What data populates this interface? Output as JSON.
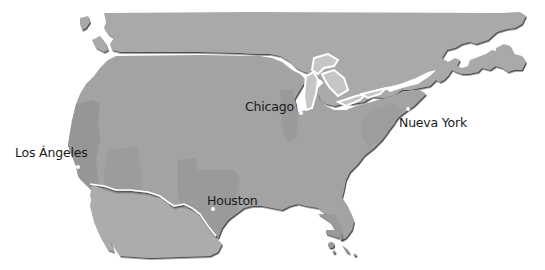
{
  "map": {
    "region": "North America",
    "colors": {
      "background": "#ffffff",
      "canada": "#a9a9a9",
      "usa": "#a3a3a3",
      "usa_highlight": "#969696",
      "mexico": "#acacac",
      "water": "#ffffff",
      "border_shadow": "#3c3c3c",
      "lakes": "#c9c9c9",
      "label_text": "#1a1a1a",
      "city_dot": "#ffffff"
    },
    "cities": [
      {
        "id": "chicago",
        "label": "Chicago",
        "x": 301,
        "y": 113
      },
      {
        "id": "new-york",
        "label": "Nueva York",
        "x": 408,
        "y": 109
      },
      {
        "id": "los-angeles",
        "label": "Los Ángeles",
        "x": 78,
        "y": 167
      },
      {
        "id": "houston",
        "label": "Houston",
        "x": 229,
        "y": 209
      }
    ]
  }
}
